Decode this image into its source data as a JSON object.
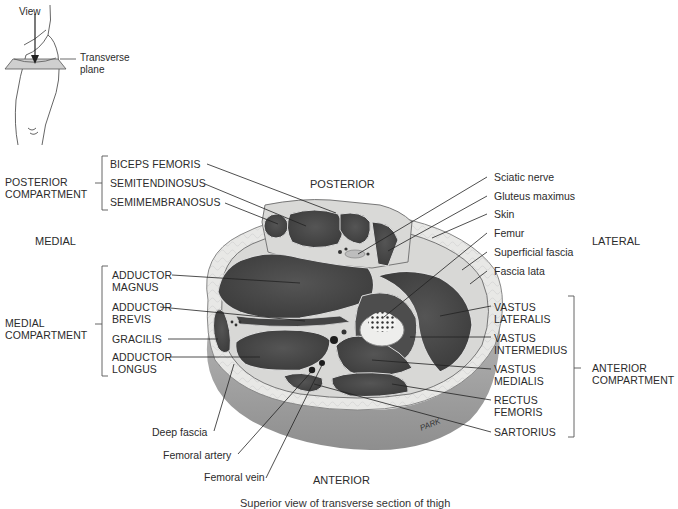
{
  "inset": {
    "view_label": "View",
    "plane_label_line1": "Transverse",
    "plane_label_line2": "plane"
  },
  "orientation": {
    "posterior": "POSTERIOR",
    "anterior": "ANTERIOR",
    "medial": "MEDIAL",
    "lateral": "LATERAL"
  },
  "compartments": {
    "posterior": {
      "line1": "POSTERIOR",
      "line2": "COMPARTMENT",
      "muscles": [
        "BICEPS FEMORIS",
        "SEMITENDINOSUS",
        "SEMIMEMBRANOSUS"
      ]
    },
    "medial": {
      "line1": "MEDIAL",
      "line2": "COMPARTMENT",
      "muscles": [
        {
          "line1": "ADDUCTOR",
          "line2": "MAGNUS"
        },
        {
          "line1": "ADDUCTOR",
          "line2": "BREVIS"
        },
        {
          "line1": "GRACILIS",
          "line2": ""
        },
        {
          "line1": "ADDUCTOR",
          "line2": "LONGUS"
        }
      ]
    },
    "anterior": {
      "line1": "ANTERIOR",
      "line2": "COMPARTMENT",
      "muscles": [
        {
          "line1": "VASTUS",
          "line2": "LATERALIS"
        },
        {
          "line1": "VASTUS",
          "line2": "INTERMEDIUS"
        },
        {
          "line1": "VASTUS",
          "line2": "MEDIALIS"
        },
        {
          "line1": "RECTUS",
          "line2": "FEMORIS"
        },
        {
          "line1": "SARTORIUS",
          "line2": ""
        }
      ]
    }
  },
  "right_labels": [
    "Sciatic nerve",
    "Gluteus maximus",
    "Skin",
    "Femur",
    "Superficial fascia",
    "Fascia lata"
  ],
  "bottom_labels": [
    "Deep fascia",
    "Femoral artery",
    "Femoral vein"
  ],
  "signature": "PARK",
  "caption": "Superior view of transverse section of thigh",
  "colors": {
    "muscle": "#4a4a4a",
    "fat": "#e6e6e6",
    "skin_side": "#9a9a9a",
    "bone": "#f0f0ee"
  }
}
